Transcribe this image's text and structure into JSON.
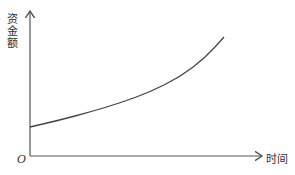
{
  "chart_data": {
    "type": "line",
    "title": "",
    "xlabel": "时间",
    "ylabel": "资金额",
    "origin_label": "O",
    "grid": false,
    "legend": null,
    "ticks": false,
    "series": [
      {
        "name": "资金额",
        "description": "exponential growth curve starting above zero",
        "points_px": [
          [
            30,
            127
          ],
          [
            60,
            120
          ],
          [
            90,
            112
          ],
          [
            120,
            103
          ],
          [
            150,
            92
          ],
          [
            180,
            77
          ],
          [
            205,
            58
          ],
          [
            224,
            37
          ]
        ]
      }
    ],
    "axis_color": "#555555",
    "line_color": "#444444"
  }
}
